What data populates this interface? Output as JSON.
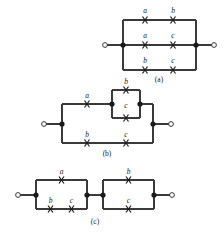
{
  "figure": {
    "type": "switching-circuit-diagram",
    "background_color": "#ffffff",
    "line_color": "#3a3a3a",
    "text_color": "#1a1a1a",
    "node_color": "#1a1a1a",
    "terminal_fill": "#ffffff",
    "symbols": {
      "switch": "x-contact",
      "node": "filled-dot",
      "terminal": "open-circle"
    },
    "panels": [
      {
        "caption": "(a)",
        "description": "three parallel branches between two terminals",
        "switch_labels": [
          "a",
          "b",
          "a",
          "c",
          "b",
          "c"
        ],
        "rows": [
          {
            "position": "top",
            "labels": [
              "a",
              "b"
            ]
          },
          {
            "position": "middle",
            "labels": [
              "a",
              "c"
            ]
          },
          {
            "position": "bottom",
            "labels": [
              "b",
              "c"
            ]
          }
        ]
      },
      {
        "caption": "(b)",
        "description": "upper branch a in series with parallel b and c; lower branch b in series with c",
        "switch_labels": [
          "a",
          "b",
          "c",
          "b",
          "c"
        ],
        "rows": [
          {
            "position": "upper",
            "labels": [
              "a"
            ]
          },
          {
            "position": "inner-top",
            "labels": [
              "b"
            ]
          },
          {
            "position": "inner-bottom",
            "labels": [
              "c"
            ]
          },
          {
            "position": "lower",
            "labels": [
              "b",
              "c"
            ]
          }
        ]
      },
      {
        "caption": "(c)",
        "description": "two parallel blocks in series",
        "switch_labels": [
          "a",
          "b",
          "c",
          "b",
          "c"
        ],
        "rows": [
          {
            "position": "left-top",
            "labels": [
              "a"
            ]
          },
          {
            "position": "left-bottom",
            "labels": [
              "b",
              "c"
            ]
          },
          {
            "position": "right-top",
            "labels": [
              "b"
            ]
          },
          {
            "position": "right-bottom",
            "labels": [
              "c"
            ]
          }
        ]
      }
    ],
    "labels": {
      "a_top_a": "a",
      "a_top_b": "b",
      "a_mid_a": "a",
      "a_mid_c": "c",
      "a_bot_b": "b",
      "a_bot_c": "c",
      "a_caption": "(a)",
      "b_up_a": "a",
      "b_in_b": "b",
      "b_in_c": "c",
      "b_low_b": "b",
      "b_low_c": "c",
      "b_caption": "(b)",
      "c_lt_a": "a",
      "c_lb_b": "b",
      "c_lb_c": "c",
      "c_rt_b": "b",
      "c_rb_c": "c",
      "c_caption": "(c)"
    }
  }
}
